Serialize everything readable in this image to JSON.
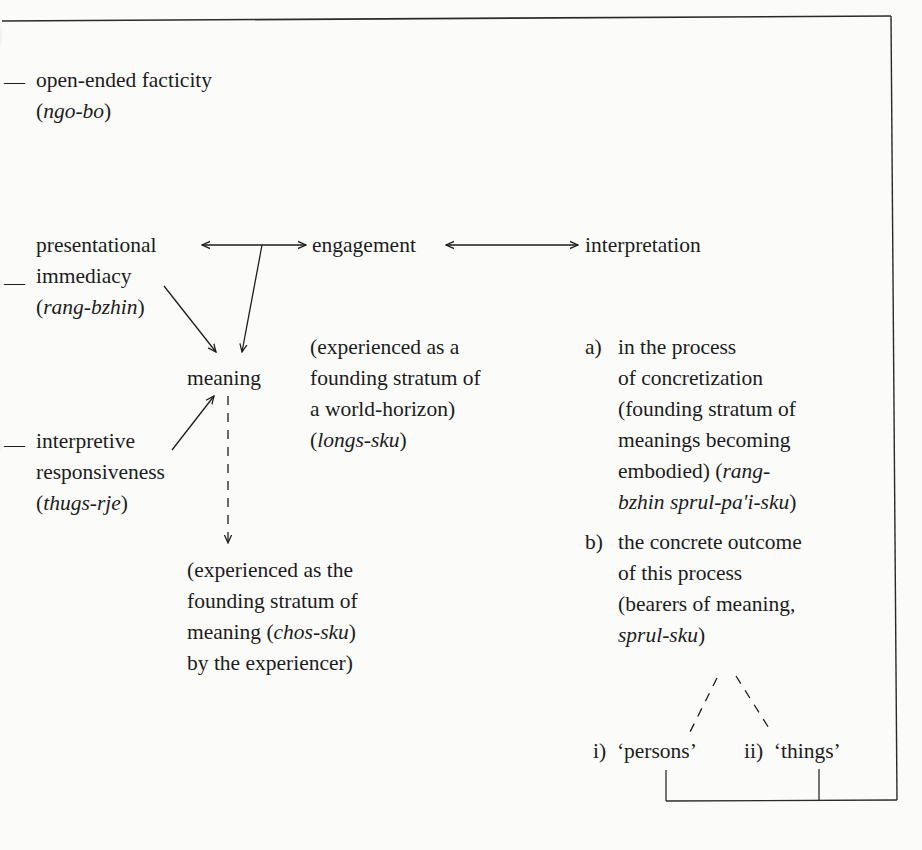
{
  "diagram": {
    "left_column": {
      "facticity": {
        "label": "open-ended facticity",
        "term": "ngo-bo"
      },
      "presentational": {
        "line1": "presentational",
        "line2": "immediacy",
        "term": "rang-bzhin"
      },
      "interpretive": {
        "line1": "interpretive",
        "line2": "responsiveness",
        "term": "thugs-rje"
      }
    },
    "top_row": {
      "engagement": "engagement",
      "interpretation": "interpretation"
    },
    "center": {
      "meaning": "meaning",
      "world_horizon": {
        "lines": [
          "(experienced as a",
          "founding stratum of",
          "a world-horizon)"
        ],
        "term": "longs-sku"
      },
      "experiencer": {
        "lines": [
          "(experienced as the",
          "founding stratum of"
        ],
        "line3_prefix": "meaning (",
        "term": "chos-sku",
        "line3_suffix": ")",
        "line4": "by the experiencer)"
      }
    },
    "right_column": {
      "a": {
        "marker": "a)",
        "lines": [
          "in the process",
          "of concretization",
          "(founding stratum of",
          "meanings becoming"
        ],
        "line5_prefix": "embodied) (",
        "line5_term": "rang-",
        "line6_term": "bzhin sprul-pa'i-sku",
        "line6_suffix": ")"
      },
      "b": {
        "marker": "b)",
        "lines": [
          "the concrete outcome",
          "of this process",
          "(bearers of meaning,"
        ],
        "term": "sprul-sku",
        "term_suffix": ")"
      },
      "sub": {
        "i": {
          "marker": "i)",
          "label": "‘persons’"
        },
        "ii": {
          "marker": "ii)",
          "label": "‘things’"
        }
      }
    },
    "edge_marks": [
      "—",
      "—",
      "—"
    ],
    "colors": {
      "ink": "#1c1c1c",
      "paper": "#fbfbfa"
    }
  }
}
